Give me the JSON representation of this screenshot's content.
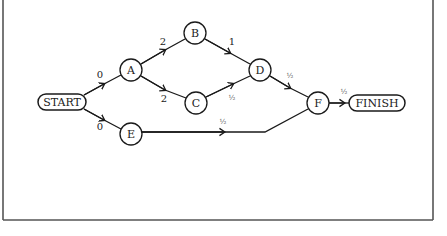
{
  "diagram": {
    "type": "activity-network",
    "colors": {
      "line": "#1a1a1a",
      "frame": "#555555",
      "background": "#ffffff"
    },
    "nodes": [
      {
        "id": "START",
        "label": "START",
        "shape": "pill",
        "x": 62,
        "y": 102,
        "w": 48,
        "h": 16
      },
      {
        "id": "A",
        "label": "A",
        "shape": "circle",
        "x": 131,
        "y": 70,
        "r": 11
      },
      {
        "id": "B",
        "label": "B",
        "shape": "circle",
        "x": 195,
        "y": 33,
        "r": 11
      },
      {
        "id": "C",
        "label": "C",
        "shape": "circle",
        "x": 196,
        "y": 103,
        "r": 11
      },
      {
        "id": "D",
        "label": "D",
        "shape": "circle",
        "x": 260,
        "y": 70,
        "r": 11
      },
      {
        "id": "E",
        "label": "E",
        "shape": "circle",
        "x": 131,
        "y": 134,
        "r": 11
      },
      {
        "id": "F",
        "label": "F",
        "shape": "circle",
        "x": 318,
        "y": 103,
        "r": 11
      },
      {
        "id": "FINISH",
        "label": "FINISH",
        "shape": "pill",
        "x": 377,
        "y": 103,
        "w": 56,
        "h": 16
      }
    ],
    "edges": [
      {
        "from": "START",
        "to": "A",
        "weight": "0"
      },
      {
        "from": "START",
        "to": "E",
        "weight": "0"
      },
      {
        "from": "A",
        "to": "B",
        "weight": "2"
      },
      {
        "from": "A",
        "to": "C",
        "weight": "2"
      },
      {
        "from": "B",
        "to": "D",
        "weight": "1"
      },
      {
        "from": "C",
        "to": "D",
        "weight": "½"
      },
      {
        "from": "D",
        "to": "F",
        "weight": "½"
      },
      {
        "from": "E",
        "to": "F",
        "weight": "½"
      },
      {
        "from": "F",
        "to": "FINISH",
        "weight": "½"
      }
    ],
    "labels": {
      "start_a": "0",
      "start_e": "0",
      "a_b": "2",
      "a_c": "2",
      "b_d": "1",
      "c_d": "½",
      "d_f": "½",
      "e_f": "½",
      "f_finish": "½"
    }
  }
}
